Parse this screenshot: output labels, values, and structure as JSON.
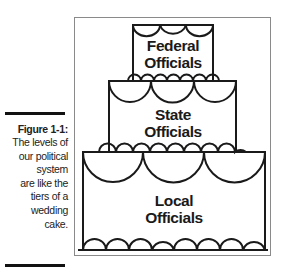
{
  "caption": {
    "title": "Figure 1-1:",
    "lines": [
      "The levels of",
      "our political",
      "system",
      "are like the",
      "tiers of a",
      "wedding",
      "cake."
    ]
  },
  "figure": {
    "tiers": [
      {
        "id": "top",
        "label_line1": "Federal",
        "label_line2": "Officials"
      },
      {
        "id": "middle",
        "label_line1": "State",
        "label_line2": "Officials"
      },
      {
        "id": "bottom",
        "label_line1": "Local",
        "label_line2": "Officials"
      }
    ]
  },
  "colors": {
    "stroke": "#1a1a1a",
    "frame": "#8a8a8a",
    "caption_bar": "#111111"
  }
}
